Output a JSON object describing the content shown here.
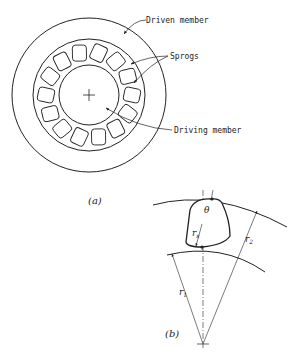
{
  "figure_a": {
    "caption": "(a)",
    "labels": {
      "driven": "Driven member",
      "sprogs": "Sprogs",
      "driving": "Driving member"
    },
    "sprog_count": 14
  },
  "figure_b": {
    "caption": "(b)",
    "symbols": {
      "theta": "θ",
      "rs": "r",
      "rs_sub": "s",
      "r1": "r",
      "r1_sub": "1",
      "r2": "r",
      "r2_sub": "2"
    }
  },
  "colors": {
    "line": "#222222",
    "background": "#ffffff"
  }
}
